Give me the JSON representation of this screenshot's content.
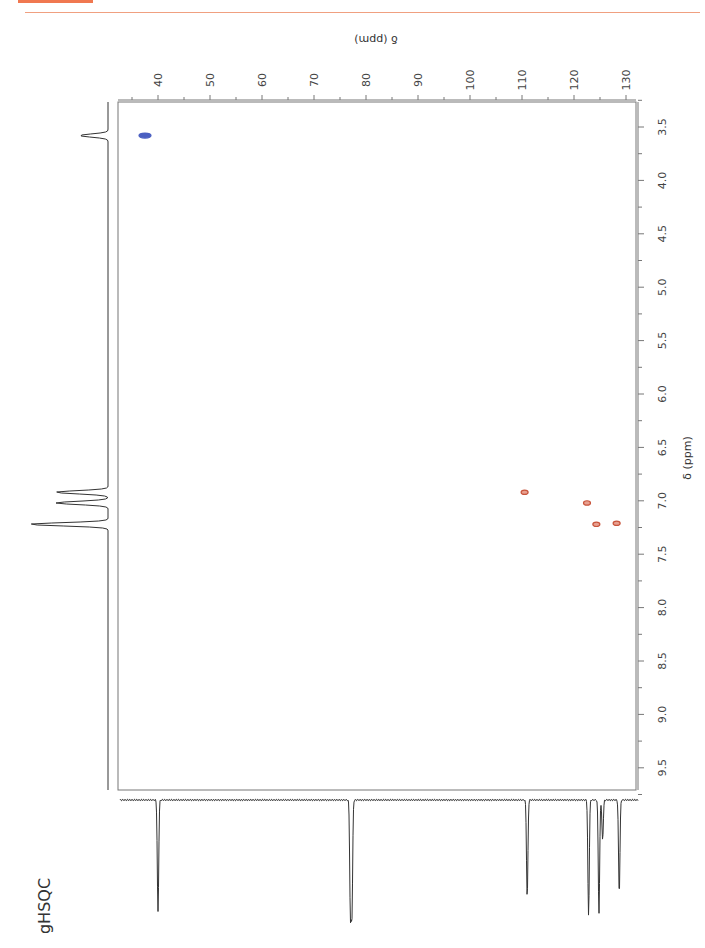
{
  "header": {
    "accent_color": "#f07850"
  },
  "experiment_label": "gHSQC",
  "chart_data": {
    "type": "heatmap",
    "subtype": "2D NMR HSQC contour plot (page rotated 90°)",
    "title": "gHSQC",
    "x_axis": {
      "label": "δ (ppm)",
      "nucleus": "13C",
      "ticks": [
        40,
        50,
        60,
        70,
        80,
        90,
        100,
        110,
        120,
        130
      ],
      "range": [
        34,
        132
      ]
    },
    "y_axis": {
      "label": "δ (ppm)",
      "nucleus": "1H",
      "ticks": [
        3.5,
        4.0,
        4.5,
        5.0,
        5.5,
        6.0,
        6.5,
        7.0,
        7.5,
        8.0,
        8.5,
        9.0,
        9.5
      ],
      "range": [
        3.25,
        9.85
      ]
    },
    "grid": false,
    "cross_peaks": [
      {
        "c13": 37.5,
        "h1": 3.58,
        "phase": "negative",
        "color": "#4a5fc1"
      },
      {
        "c13": 110.5,
        "h1": 6.92,
        "phase": "positive",
        "color": "#c8553d"
      },
      {
        "c13": 122.5,
        "h1": 7.02,
        "phase": "positive",
        "color": "#c8553d"
      },
      {
        "c13": 124.3,
        "h1": 7.22,
        "phase": "positive",
        "color": "#c8553d"
      },
      {
        "c13": 128.2,
        "h1": 7.21,
        "phase": "positive",
        "color": "#c8553d"
      }
    ],
    "projection_1h": {
      "peaks_ppm": [
        3.58,
        6.92,
        7.02,
        7.22
      ]
    },
    "projection_13c": {
      "peaks_ppm": [
        40.0,
        77.0,
        111.0,
        122.8,
        124.8,
        125.5,
        128.7
      ]
    }
  }
}
